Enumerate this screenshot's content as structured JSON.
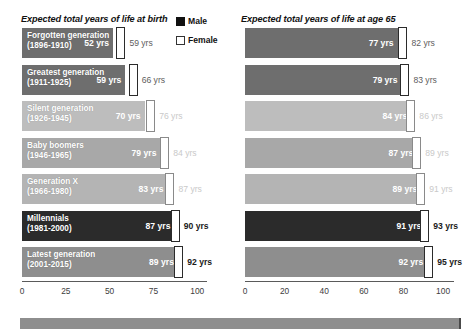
{
  "legend": {
    "items": [
      {
        "label": "Male",
        "swatch": "male-swatch-icon",
        "color": "#111111"
      },
      {
        "label": "Female",
        "swatch": "female-swatch-icon",
        "color": "#ffffff"
      }
    ]
  },
  "panels": [
    {
      "id": "at-birth",
      "title": "Expected total years of life at birth",
      "axis": {
        "min": 0,
        "max": 105,
        "ticks": [
          0,
          25,
          50,
          75,
          100
        ]
      }
    },
    {
      "id": "at-age-65",
      "title": "Expected total years of life at age 65",
      "axis": {
        "min": 0,
        "max": 105,
        "ticks": [
          0,
          20,
          40,
          60,
          80,
          100
        ]
      }
    }
  ],
  "chart_data": {
    "type": "bar",
    "title": "Expected total years of life",
    "xlabel": "",
    "ylabel": "",
    "grid": false,
    "legend_position": "top-right",
    "categories": [
      "Forgotten generation (1896-1910)",
      "Greatest generation (1911-1925)",
      "Silent generation (1926-1945)",
      "Baby boomers (1946-1965)",
      "Generation X (1966-1980)",
      "Millennials (1981-2000)",
      "Latest generation (2001-2015)"
    ],
    "category_lines": [
      [
        "Forgotten generation",
        "(1896-1910)"
      ],
      [
        "Greatest generation",
        "(1911-1925)"
      ],
      [
        "Silent generation",
        "(1926-1945)"
      ],
      [
        "Baby boomers",
        "(1946-1965)"
      ],
      [
        "Generation X",
        "(1966-1980)"
      ],
      [
        "Millennials",
        "(1981-2000)"
      ],
      [
        "Latest generation",
        "(2001-2015)"
      ]
    ],
    "bar_colors": [
      "#6e6e6e",
      "#6e6e6e",
      "#bdbdbd",
      "#a8a8a8",
      "#b4b4b4",
      "#2b2b2b",
      "#8e8e8e"
    ],
    "panels": [
      {
        "id": "at-birth",
        "title": "Expected total years of life at birth",
        "xlim": [
          0,
          105
        ],
        "xticks": [
          0,
          25,
          50,
          75,
          100
        ],
        "series": [
          {
            "name": "Male",
            "values": [
              52,
              59,
              70,
              79,
              83,
              87,
              89
            ],
            "labels": [
              "52 yrs",
              "59 yrs",
              "70 yrs",
              "79 yrs",
              "83 yrs",
              "87 yrs",
              "89 yrs"
            ]
          },
          {
            "name": "Female",
            "values": [
              59,
              66,
              76,
              84,
              87,
              90,
              92
            ],
            "labels": [
              "59 yrs",
              "66 yrs",
              "76 yrs",
              "84 yrs",
              "87 yrs",
              "90 yrs",
              "92 yrs"
            ]
          }
        ]
      },
      {
        "id": "at-age-65",
        "title": "Expected total years of life at age 65",
        "xlim": [
          0,
          105
        ],
        "xticks": [
          0,
          20,
          40,
          60,
          80,
          100
        ],
        "series": [
          {
            "name": "Male",
            "values": [
              77,
              79,
              84,
              87,
              89,
              91,
              92
            ],
            "labels": [
              "77 yrs",
              "79 yrs",
              "84 yrs",
              "87 yrs",
              "89 yrs",
              "91 yrs",
              "92 yrs"
            ]
          },
          {
            "name": "Female",
            "values": [
              82,
              83,
              86,
              89,
              91,
              93,
              95
            ],
            "labels": [
              "82 yrs",
              "83 yrs",
              "86 yrs",
              "89 yrs",
              "91 yrs",
              "93 yrs",
              "95 yrs"
            ]
          }
        ]
      }
    ]
  }
}
